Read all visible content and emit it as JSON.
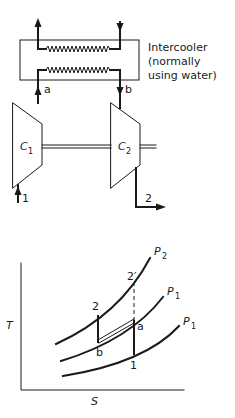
{
  "schematic": {
    "intercooler_label": [
      "Intercooler",
      "(normally",
      "using water)"
    ],
    "state_labels": {
      "a": "a",
      "b": "b",
      "inlet": "1",
      "outlet": "2"
    },
    "compressors": [
      {
        "name": "C",
        "subscript": "1"
      },
      {
        "name": "C",
        "subscript": "2"
      }
    ]
  },
  "ts_diagram": {
    "x_axis_label": "S",
    "y_axis_label": "T",
    "isobars": [
      {
        "name": "P",
        "subscript": "2"
      },
      {
        "name": "P",
        "subscript": "1"
      },
      {
        "name": "P",
        "subscript": "1"
      }
    ],
    "points": {
      "p1": "1",
      "p2": "2",
      "p2prime": "2′",
      "pa": "a",
      "pb": "b"
    }
  }
}
